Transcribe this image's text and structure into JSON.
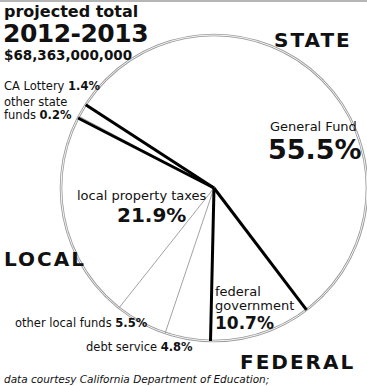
{
  "header": {
    "subtitle": "projected total",
    "year": "2012-2013",
    "total": "$68,363,000,000"
  },
  "regions": {
    "state": "STATE",
    "local": "LOCAL",
    "federal": "FEDERAL"
  },
  "labels": {
    "general_fund_name": "General Fund",
    "general_fund_pct": "55.5%",
    "federal_name_line1": "federal",
    "federal_name_line2": "government",
    "federal_pct": "10.7%",
    "debt_service_name": "debt service ",
    "debt_service_pct": "4.8%",
    "other_local_name": "other local funds ",
    "other_local_pct": "5.5%",
    "local_property_name": "local property taxes",
    "local_property_pct": "21.9%",
    "other_state_name_line1": "other state",
    "other_state_name_line2": "funds ",
    "other_state_pct": "0.2%",
    "lottery_name": "CA Lottery ",
    "lottery_pct": "1.4%"
  },
  "footer": "data courtesy California Department of Education;",
  "chart_data": {
    "type": "pie",
    "total": 68363000000,
    "start_angle_deg": 213,
    "direction": "clockwise",
    "categories": [
      "General Fund",
      "federal government",
      "debt service",
      "other local funds",
      "local property taxes",
      "other state funds",
      "CA Lottery"
    ],
    "values": [
      55.5,
      10.7,
      4.8,
      5.5,
      21.9,
      0.2,
      1.4
    ],
    "groups": [
      {
        "name": "STATE",
        "members": [
          "General Fund",
          "other state funds",
          "CA Lottery"
        ]
      },
      {
        "name": "FEDERAL",
        "members": [
          "federal government"
        ]
      },
      {
        "name": "LOCAL",
        "members": [
          "debt service",
          "other local funds",
          "local property taxes"
        ]
      }
    ],
    "group_boundaries_after": [
      "General Fund",
      "federal government",
      "local property taxes"
    ],
    "source": "data courtesy California Department of Education;"
  }
}
